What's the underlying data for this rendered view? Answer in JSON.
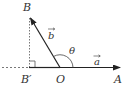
{
  "diagram": {
    "type": "vector-projection",
    "points": {
      "B": "B",
      "B_prime": "B′",
      "O": "O",
      "A": "A"
    },
    "vectors": {
      "a": "a",
      "b": "b"
    },
    "angle": "θ",
    "colors": {
      "line": "#222222",
      "dashed": "#555555"
    }
  }
}
